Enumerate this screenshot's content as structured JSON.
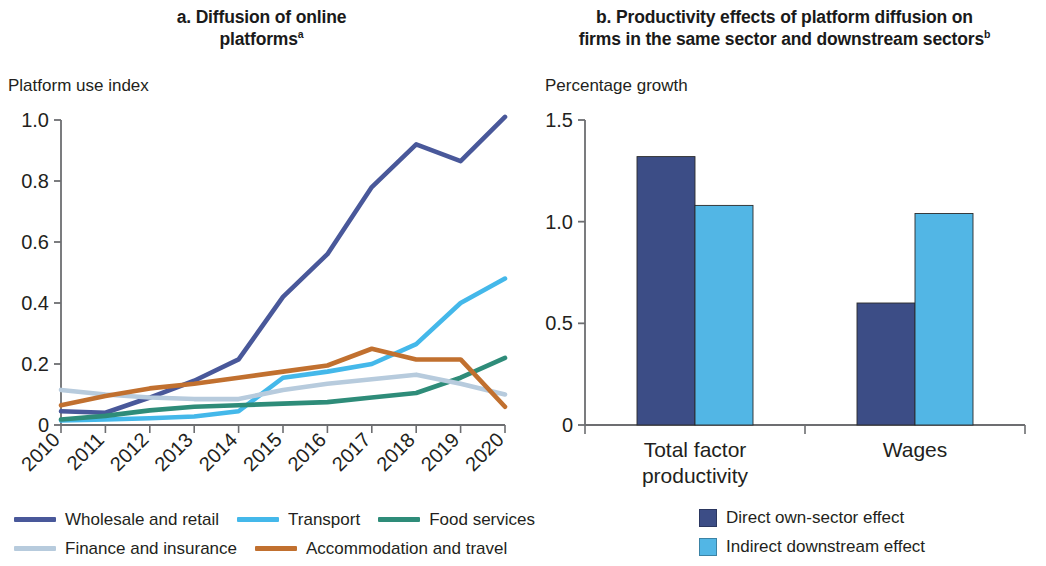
{
  "panel_a": {
    "title": "a. Diffusion of online platforms",
    "title_line1": "a. Diffusion of online",
    "title_line2": "platforms",
    "title_superscript": "a",
    "axis_caption": "Platform use index",
    "legend": [
      {
        "label": "Wholesale and retail",
        "color": "#49589a"
      },
      {
        "label": "Transport",
        "color": "#44b8ea"
      },
      {
        "label": "Food services",
        "color": "#2e8c79"
      },
      {
        "label": "Finance and insurance",
        "color": "#b7cbdd"
      },
      {
        "label": "Accommodation and travel",
        "color": "#c1702f"
      }
    ]
  },
  "panel_b": {
    "title": "b. Productivity effects of platform diffusion on firms in the same sector and downstream sectors",
    "title_line1": "b. Productivity effects of platform diffusion on",
    "title_line2": "firms in the same sector and downstream sectors",
    "title_superscript": "b",
    "axis_caption": "Percentage growth",
    "legend": [
      {
        "label": "Direct own-sector effect",
        "color": "#3c4d86"
      },
      {
        "label": "Indirect downstream effect",
        "color": "#52b6e5"
      }
    ]
  },
  "chart_data": [
    {
      "type": "line",
      "panel": "a",
      "title": "a. Diffusion of online platforms",
      "xlabel": "",
      "ylabel": "Platform use index",
      "ylim": [
        0,
        1.0
      ],
      "yticks": [
        0,
        0.2,
        0.4,
        0.6,
        0.8,
        1.0
      ],
      "ytick_labels": [
        "0",
        "0.2",
        "0.4",
        "0.6",
        "0.8",
        "1.0"
      ],
      "grid": false,
      "legend_position": "bottom",
      "x": [
        2010,
        2011,
        2012,
        2013,
        2014,
        2015,
        2016,
        2017,
        2018,
        2019,
        2020
      ],
      "xtick_labels": [
        "2010",
        "2011",
        "2012",
        "2013",
        "2014",
        "2015",
        "2016",
        "2017",
        "2018",
        "2019",
        "2020"
      ],
      "series": [
        {
          "name": "Wholesale and retail",
          "color": "#49589a",
          "values": [
            0.045,
            0.04,
            0.09,
            0.145,
            0.215,
            0.42,
            0.56,
            0.78,
            0.92,
            0.865,
            1.01
          ]
        },
        {
          "name": "Transport",
          "color": "#44b8ea",
          "values": [
            0.015,
            0.018,
            0.022,
            0.028,
            0.045,
            0.155,
            0.175,
            0.2,
            0.265,
            0.4,
            0.48
          ]
        },
        {
          "name": "Food services",
          "color": "#2e8c79",
          "values": [
            0.018,
            0.03,
            0.048,
            0.06,
            0.065,
            0.07,
            0.075,
            0.09,
            0.105,
            0.155,
            0.22
          ]
        },
        {
          "name": "Finance and insurance",
          "color": "#b7cbdd",
          "values": [
            0.115,
            0.1,
            0.09,
            0.085,
            0.085,
            0.115,
            0.135,
            0.15,
            0.165,
            0.135,
            0.1
          ]
        },
        {
          "name": "Accommodation and travel",
          "color": "#c1702f",
          "values": [
            0.065,
            0.095,
            0.12,
            0.135,
            0.155,
            0.175,
            0.195,
            0.25,
            0.215,
            0.215,
            0.06
          ]
        }
      ]
    },
    {
      "type": "bar",
      "panel": "b",
      "title": "b. Productivity effects of platform diffusion on firms in the same sector and downstream sectors",
      "xlabel": "",
      "ylabel": "Percentage growth",
      "ylim": [
        0,
        1.5
      ],
      "yticks": [
        0,
        0.5,
        1.0,
        1.5
      ],
      "ytick_labels": [
        "0",
        "0.5",
        "1.0",
        "1.5"
      ],
      "grid": false,
      "legend_position": "bottom",
      "categories": [
        "Total factor productivity",
        "Wages"
      ],
      "category_lines": [
        [
          "Total factor",
          "productivity"
        ],
        [
          "Wages"
        ]
      ],
      "series": [
        {
          "name": "Direct own-sector effect",
          "color": "#3c4d86",
          "values": [
            1.32,
            0.6
          ]
        },
        {
          "name": "Indirect downstream effect",
          "color": "#52b6e5",
          "values": [
            1.08,
            1.04
          ]
        }
      ]
    }
  ]
}
